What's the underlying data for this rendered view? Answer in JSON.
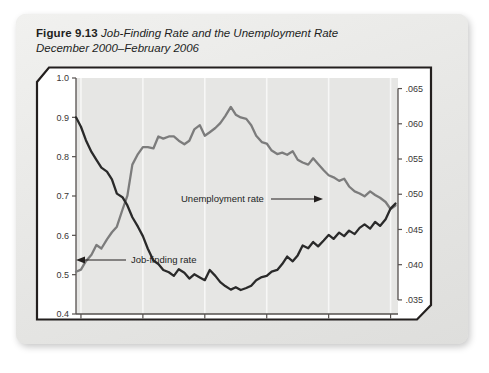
{
  "figure": {
    "number_label": "Figure 9.13",
    "title_line1": "Job-Finding Rate and the Unemployment Rate",
    "title_line2": "December 2000–February 2006"
  },
  "annotations": {
    "unemployment_label": "Unemployment rate",
    "jobfinding_label": "Job-finding rate"
  },
  "colors": {
    "unemployment_line": "#7c7c7c",
    "jobfinding_line": "#2a2a2a",
    "plot_background": "#e6e6e4",
    "gridline": "#f7f7f6",
    "axis": "#55504e",
    "card_background": "#e9e9e7",
    "frame_border": "#231f1e"
  },
  "chart_data": {
    "type": "line",
    "xlabel": "",
    "grid": true,
    "legend": "inline-annotations",
    "x_axis": {
      "tick_labels": [
        "2001",
        "2002",
        "2003",
        "2004",
        "2005"
      ],
      "range_start": 2000.92,
      "range_end": 2006.12,
      "tick_positions": [
        2001.0,
        2002.0,
        2003.0,
        2004.0,
        2005.0,
        2006.0
      ]
    },
    "y_axis_left": {
      "label": "Job-finding rate",
      "tick_labels": [
        "1.0",
        "0.9",
        "0.8",
        "0.7",
        "0.6",
        "0.5",
        "0.4"
      ],
      "ticks": [
        1.0,
        0.9,
        0.8,
        0.7,
        0.6,
        0.5,
        0.4
      ],
      "ylim": [
        0.4,
        1.0
      ]
    },
    "y_axis_right": {
      "label": "Unemployment rate",
      "tick_labels": [
        ".065",
        ".060",
        ".055",
        ".050",
        ".045",
        ".040",
        ".035"
      ],
      "ticks": [
        0.065,
        0.06,
        0.055,
        0.05,
        0.045,
        0.04,
        0.035
      ],
      "ylim": [
        0.033,
        0.0665
      ]
    },
    "x": [
      2000.92,
      2001.0,
      2001.08,
      2001.17,
      2001.25,
      2001.33,
      2001.42,
      2001.5,
      2001.58,
      2001.67,
      2001.75,
      2001.83,
      2001.92,
      2002.0,
      2002.08,
      2002.17,
      2002.25,
      2002.33,
      2002.42,
      2002.5,
      2002.58,
      2002.67,
      2002.75,
      2002.83,
      2002.92,
      2003.0,
      2003.08,
      2003.17,
      2003.25,
      2003.33,
      2003.42,
      2003.5,
      2003.58,
      2003.67,
      2003.75,
      2003.83,
      2003.92,
      2004.0,
      2004.08,
      2004.17,
      2004.25,
      2004.33,
      2004.42,
      2004.5,
      2004.58,
      2004.67,
      2004.75,
      2004.83,
      2004.92,
      2005.0,
      2005.08,
      2005.17,
      2005.25,
      2005.33,
      2005.42,
      2005.5,
      2005.58,
      2005.67,
      2005.75,
      2005.83,
      2005.92,
      2006.0,
      2006.08
    ],
    "series": [
      {
        "name": "Unemployment rate",
        "axis": "right",
        "color": "#7c7c7c",
        "values": [
          0.039,
          0.0393,
          0.0405,
          0.0414,
          0.0428,
          0.0423,
          0.0436,
          0.0446,
          0.0454,
          0.0478,
          0.0498,
          0.0542,
          0.0557,
          0.0567,
          0.0567,
          0.0565,
          0.0582,
          0.0579,
          0.0582,
          0.0582,
          0.0576,
          0.0571,
          0.0576,
          0.0592,
          0.0598,
          0.0583,
          0.0588,
          0.0594,
          0.0601,
          0.0611,
          0.0624,
          0.0613,
          0.0609,
          0.0607,
          0.0598,
          0.0583,
          0.0574,
          0.0572,
          0.0562,
          0.0557,
          0.0559,
          0.0556,
          0.0561,
          0.0549,
          0.0545,
          0.0542,
          0.0551,
          0.0543,
          0.0534,
          0.0527,
          0.0524,
          0.0519,
          0.0522,
          0.0511,
          0.0504,
          0.0501,
          0.0497,
          0.0504,
          0.0499,
          0.0495,
          0.0489,
          0.0479,
          0.0484
        ]
      },
      {
        "name": "Job-finding rate",
        "axis": "left",
        "color": "#2a2a2a",
        "values": [
          0.9,
          0.876,
          0.842,
          0.812,
          0.792,
          0.772,
          0.762,
          0.742,
          0.706,
          0.697,
          0.676,
          0.646,
          0.622,
          0.598,
          0.566,
          0.536,
          0.527,
          0.512,
          0.506,
          0.497,
          0.514,
          0.505,
          0.49,
          0.501,
          0.493,
          0.486,
          0.512,
          0.497,
          0.481,
          0.471,
          0.462,
          0.468,
          0.461,
          0.466,
          0.472,
          0.486,
          0.494,
          0.497,
          0.508,
          0.512,
          0.527,
          0.546,
          0.534,
          0.549,
          0.574,
          0.567,
          0.583,
          0.572,
          0.587,
          0.601,
          0.591,
          0.607,
          0.598,
          0.612,
          0.603,
          0.619,
          0.628,
          0.617,
          0.634,
          0.624,
          0.641,
          0.668,
          0.681
        ]
      }
    ]
  }
}
